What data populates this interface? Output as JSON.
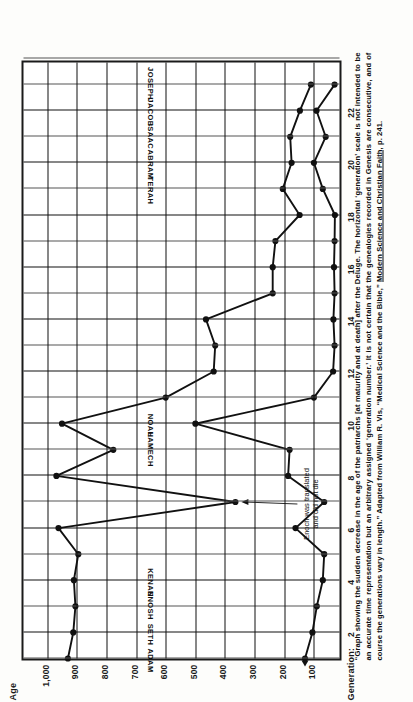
{
  "figure": {
    "age_axis_title": "Age",
    "generation_axis_title": "Generation:",
    "age_ticks": [
      "1,000",
      "900",
      "800",
      "700",
      "600",
      "500",
      "400",
      "300",
      "200",
      "100"
    ],
    "generation_ticks": [
      "2",
      "4",
      "6",
      "8",
      "10",
      "12",
      "14",
      "16",
      "18",
      "20",
      "22"
    ],
    "annotation": {
      "line1": "Enoch was translated",
      "line2": "and did not die"
    },
    "caption": {
      "part1": "“Graph showing the sudden decrease in the age of the patriarchs [at maturity and at death] after the Deluge.  The horizontal ‘generation’ scale is not intended to be an accurate time representation but an arbitrary assigned ‘generation number.’  It is not certain that the genealogies recorded in Genesis are consecutive, and of course the generations vary in length.”  Adapted from William R. Vis, “Medical Science and the Bible,” ",
      "source_italic": "Modern Science and Christian Faith,",
      "part2": " p. 241."
    },
    "colors": {
      "ink": "#111111",
      "paper": "#fdfdfb",
      "grid": "#2b2b2b"
    }
  },
  "chart_data": {
    "type": "line",
    "xlabel": "Generation:",
    "ylabel": "Age",
    "xlim": [
      1,
      24
    ],
    "ylim": [
      0,
      1080
    ],
    "grid": true,
    "legend": "none",
    "xticks": [
      2,
      4,
      6,
      8,
      10,
      12,
      14,
      16,
      18,
      20,
      22
    ],
    "yticks": [
      100,
      200,
      300,
      400,
      500,
      600,
      700,
      800,
      900,
      1000
    ],
    "x": [
      1,
      2,
      3,
      4,
      5,
      6,
      7,
      8,
      9,
      10,
      11,
      12,
      13,
      14,
      15,
      16,
      17,
      18,
      19,
      20,
      21,
      22,
      23
    ],
    "point_labels": [
      "ADAM",
      "SETH",
      "ENOSH",
      "KENAN",
      "MAHALALEL",
      "JARED",
      "ENOCH",
      "METHUSELAH",
      "LAMECH",
      "NOAH",
      "SHEM",
      "ARPACHSHAD",
      "SHELAH",
      "EBER",
      "PELEG",
      "REU",
      "SERUG",
      "NAHOR",
      "TERAH",
      "ABRAM",
      "ISAAC",
      "JACOB",
      "JOSEPH"
    ],
    "visible_point_labels": [
      "ADAM",
      "SETH",
      "ENOSH",
      "KENAN",
      "LAMECH",
      "NOAH",
      "TERAH",
      "ABRAM",
      "ISAAC",
      "JACOB",
      "JOSEPH"
    ],
    "series": [
      {
        "name": "Age at death",
        "values": [
          930,
          912,
          905,
          910,
          895,
          962,
          365,
          969,
          777,
          950,
          600,
          438,
          433,
          464,
          239,
          239,
          230,
          148,
          205,
          175,
          180,
          147,
          110
        ]
      },
      {
        "name": "Age at maturity",
        "values": [
          130,
          105,
          90,
          70,
          65,
          162,
          65,
          187,
          182,
          500,
          100,
          35,
          30,
          34,
          30,
          32,
          30,
          29,
          70,
          100,
          60,
          91,
          30
        ]
      }
    ],
    "annotations": [
      {
        "text": "Enoch was translated and did not die",
        "points_to_generation": 7,
        "points_to_age": 365
      }
    ]
  }
}
